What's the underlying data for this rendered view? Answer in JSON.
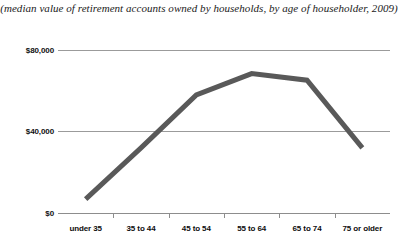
{
  "chart_data": {
    "type": "line",
    "title": "(median value of retirement accounts owned by households, by age of householder, 2009)",
    "xlabel": "",
    "ylabel": "",
    "categories": [
      "under 35",
      "35 to 44",
      "45 to 54",
      "55 to 64",
      "65 to 74",
      "75 or older"
    ],
    "values": [
      8500,
      40000,
      72500,
      85500,
      81500,
      40000
    ],
    "series": [
      {
        "name": "median retirement account value",
        "values": [
          8500,
          40000,
          72500,
          85500,
          81500,
          40000
        ],
        "color": "#595959"
      }
    ],
    "ylim": [
      0,
      100000
    ],
    "ytick_values": [
      0,
      40000,
      80000
    ],
    "ytick_labels": [
      "$0",
      "$40,000",
      "$80,000"
    ],
    "grid": true,
    "gridline_color": "#9b9b9b",
    "legend": false,
    "markers": false,
    "line_width_px": 5,
    "background": "#ffffff"
  },
  "axes": {
    "y_ticks": [
      {
        "label": "$80,000",
        "value": 80000
      },
      {
        "label": "$40,000",
        "value": 40000
      },
      {
        "label": "$0",
        "value": 0
      }
    ],
    "x_categories": [
      {
        "label": "under 35"
      },
      {
        "label": "35 to 44"
      },
      {
        "label": "45 to 54"
      },
      {
        "label": "55 to 64"
      },
      {
        "label": "65 to 74"
      },
      {
        "label": "75 or older"
      }
    ]
  },
  "colors": {
    "series_line": "#595959",
    "gridline": "#9b9b9b",
    "axis": "#8d8d8d",
    "text": "#111111",
    "background": "#ffffff"
  }
}
